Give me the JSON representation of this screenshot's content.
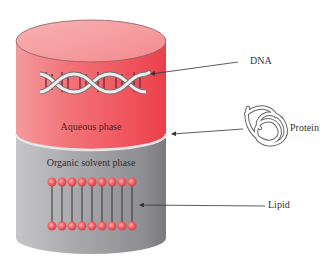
{
  "diagram": {
    "title": "",
    "cylinder": {
      "top_phase": {
        "label": "Aqueous phase",
        "color": "#f0505a"
      },
      "bottom_phase": {
        "label": "Organic solvent phase",
        "color": "#9a9a9e"
      }
    },
    "callouts": [
      {
        "label": "DNA",
        "target": "aqueous phase (DNA double helix)"
      },
      {
        "label": "Protein",
        "target": "interphase"
      },
      {
        "label": "Lipid",
        "target": "organic solvent phase (lipid bilayer)"
      }
    ],
    "lipid_heads_per_row": 9
  }
}
